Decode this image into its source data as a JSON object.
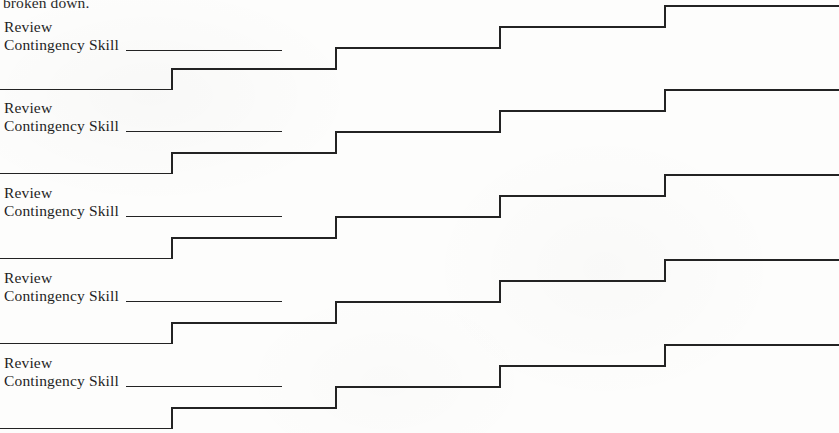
{
  "page": {
    "width": 839,
    "height": 433,
    "background_color": "#fdfdfc",
    "ink_color": "#232323",
    "clipped_top_text": "broken down."
  },
  "entries": [
    {
      "line1": "Review",
      "line2": "Contingency Skill",
      "blank_rule": true,
      "label_top": 18,
      "stair_top": 0
    },
    {
      "line1": "Review",
      "line2": "Contingency Skill",
      "blank_rule": true,
      "label_top": 99,
      "stair_top": 84
    },
    {
      "line1": "Review",
      "line2": "Contingency Skill",
      "blank_rule": true,
      "label_top": 184,
      "stair_top": 169
    },
    {
      "line1": "Review",
      "line2": "Contingency Skill",
      "blank_rule": true,
      "label_top": 269,
      "stair_top": 254
    },
    {
      "line1": "Review",
      "line2": "Contingency Skill",
      "blank_rule": true,
      "label_top": 354,
      "stair_top": 339
    }
  ],
  "stair_pattern": {
    "description": "Rising staircase rule: flat baseline then four equal risers stepping upward to the right margin.",
    "total_width": 839,
    "total_height": 90,
    "baseline_y": 90,
    "step_rise": 21,
    "riser_x": [
      172,
      336,
      500,
      665
    ],
    "start_x": 0,
    "end_x": 839,
    "stroke_width": 1.7
  }
}
